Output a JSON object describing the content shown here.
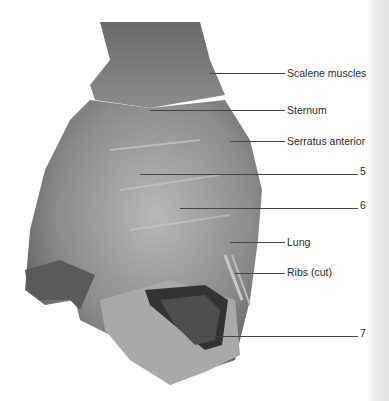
{
  "figure": {
    "labels": [
      {
        "id": "scalene",
        "text": "Scalene muscles",
        "x": 287,
        "y": 67,
        "line_x1": 210,
        "line_x2": 285,
        "line_y": 73
      },
      {
        "id": "sternum",
        "text": "Sternum",
        "x": 287,
        "y": 104,
        "line_x1": 150,
        "line_x2": 285,
        "line_y": 110
      },
      {
        "id": "serratus",
        "text": "Serratus anterior",
        "x": 287,
        "y": 135,
        "line_x1": 230,
        "line_x2": 285,
        "line_y": 141
      },
      {
        "id": "n5",
        "text": "5",
        "x": 360,
        "y": 165,
        "line_x1": 140,
        "line_x2": 358,
        "line_y": 174
      },
      {
        "id": "n6",
        "text": "6",
        "x": 360,
        "y": 199,
        "line_x1": 180,
        "line_x2": 358,
        "line_y": 208
      },
      {
        "id": "lung",
        "text": "Lung",
        "x": 287,
        "y": 236,
        "line_x1": 230,
        "line_x2": 285,
        "line_y": 242
      },
      {
        "id": "ribs",
        "text": "Ribs (cut)",
        "x": 287,
        "y": 266,
        "line_x1": 235,
        "line_x2": 285,
        "line_y": 273
      },
      {
        "id": "n7",
        "text": "7",
        "x": 360,
        "y": 327,
        "line_x1": 200,
        "line_x2": 358,
        "line_y": 336
      }
    ]
  }
}
